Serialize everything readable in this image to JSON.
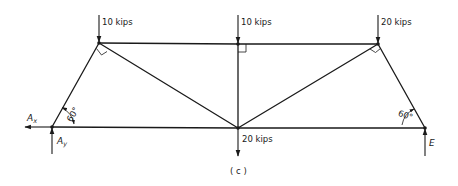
{
  "figure_label": "( c )",
  "loads": [
    {
      "node": "B",
      "label": "10 kips",
      "direction": "down"
    },
    {
      "node": "C",
      "label": "10 kips",
      "direction": "down"
    },
    {
      "node": "D",
      "label": "20 kips",
      "direction": "down"
    },
    {
      "node": "F",
      "label": "20 kips",
      "direction": "down"
    }
  ],
  "reactions": {
    "ax": {
      "symbol": "A",
      "subscript": "x",
      "direction": "left"
    },
    "ay": {
      "symbol": "A",
      "subscript": "y",
      "direction": "up"
    },
    "e": {
      "symbol": "E",
      "direction": "up"
    }
  },
  "angles": {
    "left": "60°",
    "right": "60°"
  },
  "members": [
    "AB",
    "BC",
    "CD",
    "DE",
    "AF",
    "FE",
    "BF",
    "CF",
    "DF"
  ],
  "right_angle_marks": [
    "B",
    "C",
    "D"
  ]
}
